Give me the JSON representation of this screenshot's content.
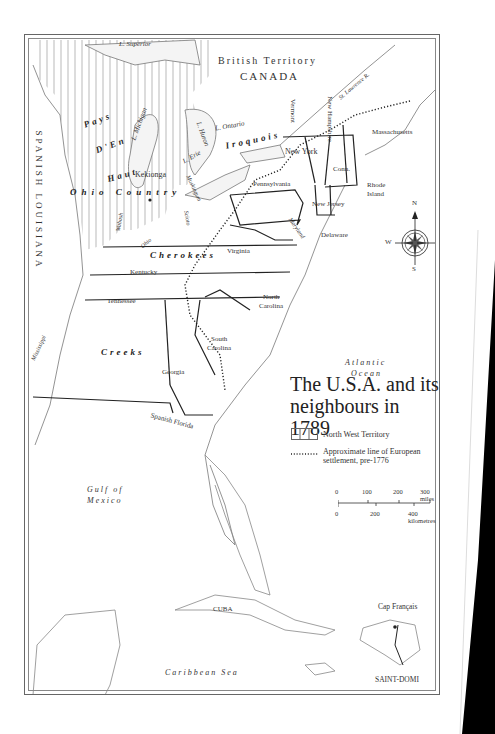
{
  "map": {
    "title_line1": "The U.S.A. and its",
    "title_line2": "neighbours in 1789",
    "legend": [
      {
        "symbol": "hatched-box",
        "label": "North West Territory"
      },
      {
        "symbol": "dotted-line",
        "label_line1": "Approximate line of European",
        "label_line2": "settlement, pre-1776"
      }
    ],
    "scale": {
      "miles_ticks": [
        "0",
        "100",
        "200",
        "300 miles"
      ],
      "km_ticks": [
        "0",
        "200",
        "400 kilometres"
      ]
    },
    "compass": {
      "n": "N",
      "s": "S",
      "e": "E",
      "w": "W"
    },
    "regions": {
      "british_territory": "British Territory",
      "canada": "CANADA",
      "spanish_louisiana": "SPANISH LOUISIANA",
      "spanish_florida": "Spanish Florida",
      "pays": "Pays",
      "den": "D'En",
      "haut": "Haut",
      "ohio_country": "Ohio Country",
      "iroquois": "Iroquois",
      "cherokees": "Cherokees",
      "creeks": "Creeks"
    },
    "states": {
      "new_york": "New York",
      "vermont": "Vermont",
      "new_hampshire": "New Hampshire",
      "massachusetts": "Massachusetts",
      "conn": "Conn.",
      "rhode_island_1": "Rhode",
      "rhode_island_2": "Island",
      "pennsylvania": "Pennsylvania",
      "new_jersey": "New Jersey",
      "delaware": "Delaware",
      "maryland": "Maryland",
      "virginia": "Virginia",
      "kentucky": "Kentucky",
      "tennessee": "Tennessee",
      "north_carolina_1": "North",
      "north_carolina_2": "Carolina",
      "south_carolina_1": "South",
      "south_carolina_2": "Carolina",
      "georgia": "Georgia"
    },
    "water": {
      "l_superior": "L. Superior",
      "l_michigan": "L. Michigan",
      "l_huron": "L. Huron",
      "l_ontario": "L. Ontario",
      "l_erie": "L. Erie",
      "st_lawrence": "St. Lawrence R.",
      "muskingum": "Muskingum",
      "scioto": "Scioto",
      "wabash": "Wabash",
      "ohio": "Ohio",
      "mississippi": "Mississippi",
      "atlantic_1": "Atlantic",
      "atlantic_2": "Ocean",
      "gulf_1": "Gulf of",
      "gulf_2": "Mexico",
      "caribbean": "Caribbean Sea"
    },
    "places": {
      "kekionga": "Kekionga",
      "cuba": "CUBA",
      "cap_francais": "Cap Français",
      "saint_domingue": "SAINT-DOMI"
    }
  }
}
